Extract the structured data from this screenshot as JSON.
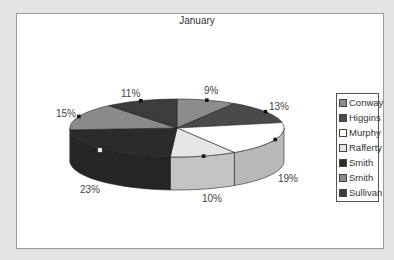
{
  "chart_data": {
    "type": "pie",
    "style": "3d-pie",
    "title": "January",
    "categories": [
      "Conway",
      "Higgins",
      "Murphy",
      "Rafferty",
      "Smith",
      "Smith",
      "Sullivan"
    ],
    "values": [
      9,
      13,
      19,
      10,
      23,
      15,
      11
    ],
    "value_labels": [
      "9%",
      "13%",
      "19%",
      "10%",
      "23%",
      "15%",
      "11%"
    ],
    "colors": [
      "#8c8c8c",
      "#4a4a4a",
      "#ffffff",
      "#e6e6e6",
      "#2b2b2b",
      "#8a8a8a",
      "#3c3c3c"
    ],
    "legend_position": "right",
    "start_angle": "12 o'clock",
    "direction": "clockwise"
  },
  "legend": {
    "items": [
      {
        "label": "Conway",
        "color": "#8c8c8c"
      },
      {
        "label": "Higgins",
        "color": "#4a4a4a"
      },
      {
        "label": "Murphy",
        "color": "#ffffff"
      },
      {
        "label": "Rafferty",
        "color": "#e6e6e6"
      },
      {
        "label": "Smith",
        "color": "#2b2b2b"
      },
      {
        "label": "Smith",
        "color": "#8a8a8a"
      },
      {
        "label": "Sullivan",
        "color": "#3c3c3c"
      }
    ]
  },
  "labels": {
    "conway": "9%",
    "higgins": "13%",
    "murphy": "19%",
    "rafferty": "10%",
    "smith1": "23%",
    "smith2": "15%",
    "sullivan": "11%"
  }
}
